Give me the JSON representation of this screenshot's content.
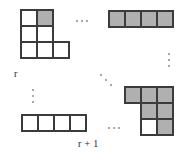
{
  "figure": {
    "width": 191,
    "height": 156,
    "background_color": "#ffffff",
    "cell_border_color": "#3b3b3b",
    "cell_shaded_color": "#b0b0b0",
    "cell_white_color": "#ffffff",
    "ellipsis_color": "#8a8a8a"
  },
  "labels": {
    "r": "r",
    "r_plus_1": "r + 1"
  },
  "shapes": [
    {
      "id": "shape-top-left",
      "name": "young-diagram-r",
      "x": 20,
      "y": 9,
      "rows": [
        [
          "white",
          "shaded"
        ],
        [
          "white",
          "white"
        ],
        [
          "white",
          "white",
          "white"
        ]
      ]
    },
    {
      "id": "shape-top-right",
      "name": "shaded-row-strip",
      "x": 108,
      "y": 10,
      "rows": [
        [
          "shaded",
          "shaded",
          "shaded",
          "shaded"
        ]
      ]
    },
    {
      "id": "shape-bottom-left",
      "name": "white-row-strip",
      "x": 21,
      "y": 114,
      "rows": [
        [
          "white",
          "white",
          "white",
          "white"
        ]
      ]
    },
    {
      "id": "shape-bottom-right",
      "name": "young-diagram-r-plus-1",
      "x": 124,
      "y": 86,
      "rows": [
        [
          "shaded",
          "shaded",
          "shaded"
        ],
        [
          "blank",
          "shaded",
          "shaded"
        ],
        [
          "blank",
          "white",
          "shaded"
        ]
      ]
    }
  ],
  "ellipses": [
    {
      "id": "ellipsis-top-horizontal",
      "name": "horizontal-ellipsis-top",
      "orientation": "horizontal",
      "x": 76,
      "y": 20,
      "text": "..."
    },
    {
      "id": "ellipsis-right-vertical",
      "name": "vertical-ellipsis-right",
      "orientation": "vertical",
      "x": 168,
      "y": 53,
      "text": "..."
    },
    {
      "id": "ellipsis-center-diagonal",
      "name": "diagonal-ellipsis-center",
      "orientation": "diagonal",
      "x": 100,
      "y": 74,
      "text": "..."
    },
    {
      "id": "ellipsis-left-vertical",
      "name": "vertical-ellipsis-left",
      "orientation": "vertical",
      "x": 32,
      "y": 89,
      "text": "..."
    },
    {
      "id": "ellipsis-bottom-horizontal",
      "name": "horizontal-ellipsis-bottom",
      "orientation": "horizontal",
      "x": 108,
      "y": 127,
      "text": "..."
    }
  ],
  "label_positions": {
    "r": {
      "x": 14,
      "y": 68
    },
    "r_plus_1": {
      "x": 78,
      "y": 138
    }
  }
}
